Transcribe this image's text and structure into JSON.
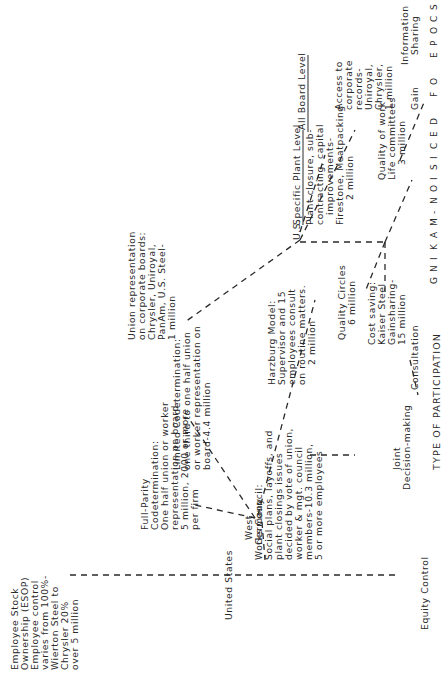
{
  "axes": {
    "y_axis_title": "SCOPE OF DECISION-MAKING",
    "y_axis_letters": [
      "S",
      "C",
      "O",
      "P",
      "E",
      " ",
      "O",
      "F",
      " ",
      "D",
      "E",
      "C",
      "I",
      "S",
      "I",
      "O",
      "N",
      "-",
      "M",
      "A",
      "K",
      "I",
      "N",
      "G"
    ],
    "x_axis_title": "TYPE OF PARTICIPATION",
    "x_categories": [
      "Equity Control",
      "Joint Decision-making",
      "Consultation",
      "Gain Sharing",
      "Information Sharing"
    ],
    "scope_levels": [
      "All Board Level",
      "Specific Plant Level"
    ]
  },
  "countries": {
    "us": "U.S.",
    "united_states": "United States",
    "west_germany_line1": "West",
    "west_germany_line2": "Germany"
  },
  "nodes": {
    "access_records": [
      "Access to",
      "corporate",
      "records-",
      "Uniroyal,",
      "Chrysler,",
      "1 million"
    ],
    "plant_closure": [
      "Plant closure, sub-",
      "contracting, capital",
      "improvements-",
      "Firestone, Meatpacking",
      "2 million"
    ],
    "union_rep": [
      "Union representation",
      "on corporate boards:",
      "Chrysler, Uniroyal,",
      "PanAm, U.S. Steel-",
      "1 million"
    ],
    "quality_work_life": [
      "Quality of work",
      "Life committees",
      "3 million"
    ],
    "cost_saving": [
      "Cost saving:",
      "Kaiser Steel",
      "Gainsharing-",
      "15 million"
    ],
    "quality_circles": [
      "Quality Circles",
      "6 million"
    ],
    "harzburg": [
      "Harzburg Model:",
      "Supervisor and 15",
      "employees consult",
      "on routine matters.",
      "2 million"
    ],
    "limited_codetermination": [
      "Limited Codetermination:",
      "one third to one half union",
      "or worker representation on",
      "board-4.4 million"
    ],
    "full_parity": [
      "Full-Parity",
      "Codetermination:",
      "One half union or worker",
      "representation on board-",
      "5 million, 2000 or more",
      "per firm"
    ],
    "works_council": [
      "Works Council:",
      "Social plans, layoffs, and",
      "plant closings issues",
      "decided by vote of union,",
      "worker & mgt. council",
      "members-10.3 million,",
      "5 or more employees"
    ],
    "esop": [
      "Employee Stock",
      "Ownership (ESOP)",
      "Employee control",
      "varies from 100%-",
      "Wierton Steel to",
      "Chrysler 20%",
      "over 5 million"
    ]
  },
  "categories_labels": {
    "equity_control": "Equity Control",
    "joint_1": "Joint",
    "joint_2": "Decision-making",
    "consultation": "Consultation",
    "gain": "Gain",
    "information": "Information",
    "sharing": "Sharing"
  },
  "colors": {
    "ink": "#2a2a2a",
    "background": "#ffffff"
  }
}
